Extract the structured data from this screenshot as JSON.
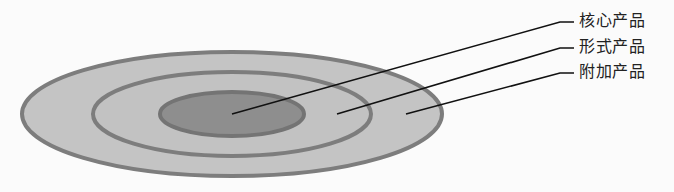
{
  "diagram": {
    "type": "concentric-ellipses",
    "colors": {
      "outline": "#7d7d7d",
      "outer_fill": "#c4c4c4",
      "middle_fill": "#c2c2c2",
      "core_fill": "#8e8e8e",
      "leader": "#111111",
      "text": "#222222"
    },
    "layers": [
      {
        "name": "核心产品",
        "cx": 232,
        "cy": 114,
        "rx": 72,
        "ry": 22
      },
      {
        "name": "形式产品",
        "cx": 232,
        "cy": 114,
        "rx": 140,
        "ry": 42
      },
      {
        "name": "附加产品",
        "cx": 232,
        "cy": 114,
        "rx": 210,
        "ry": 62
      }
    ],
    "labels": [
      {
        "text": "核心产品",
        "anchor_x": 232,
        "anchor_y": 114,
        "bend_x": 560,
        "bend_y": 22
      },
      {
        "text": "形式产品",
        "anchor_x": 337,
        "anchor_y": 114,
        "bend_x": 560,
        "bend_y": 48
      },
      {
        "text": "附加产品",
        "anchor_x": 406,
        "anchor_y": 114,
        "bend_x": 560,
        "bend_y": 73
      }
    ]
  }
}
